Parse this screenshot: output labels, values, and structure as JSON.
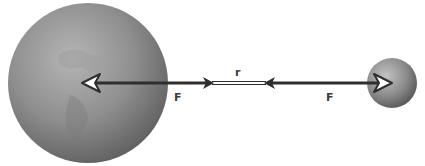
{
  "diagram": {
    "type": "gravitational-force",
    "bodies": [
      {
        "name": "earth",
        "cx": 88,
        "cy": 83,
        "r": 80
      },
      {
        "name": "moon",
        "cx": 392,
        "cy": 83,
        "r": 25
      }
    ],
    "labels": {
      "force_left": "F",
      "force_right": "F",
      "distance": "r"
    },
    "colors": {
      "arrow": "#2e2e2e",
      "earth_light": "#b5b5b5",
      "earth_dark": "#5e5e5e",
      "moon_light": "#c2c2c2",
      "moon_dark": "#555555",
      "label": "#3a3a3a"
    }
  }
}
